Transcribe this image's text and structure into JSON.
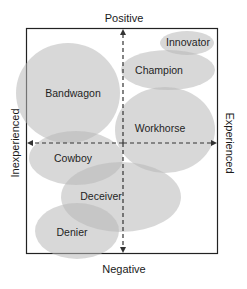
{
  "axes": {
    "top": "Positive",
    "bottom": "Negative",
    "left": "Inexperienced",
    "right": "Experienced"
  },
  "colors": {
    "ellipse_fill": "#b8b8b8",
    "ellipse_opacity": 0.55,
    "frame": "#222222",
    "axis": "#333333",
    "background": "#ffffff"
  },
  "categories": [
    {
      "label": "Innovator",
      "cx": 187,
      "cy": 43,
      "rx": 27,
      "ry": 12,
      "lx": 188,
      "ly": 46
    },
    {
      "label": "Champion",
      "cx": 168,
      "cy": 70,
      "rx": 47,
      "ry": 20,
      "lx": 159,
      "ly": 74
    },
    {
      "label": "Bandwagon",
      "cx": 68,
      "cy": 93,
      "rx": 52,
      "ry": 50,
      "lx": 73,
      "ly": 97
    },
    {
      "label": "Workhorse",
      "cx": 165,
      "cy": 130,
      "rx": 50,
      "ry": 43,
      "lx": 160,
      "ly": 132
    },
    {
      "label": "Cowboy",
      "cx": 76,
      "cy": 158,
      "rx": 47,
      "ry": 27,
      "lx": 73,
      "ly": 162
    },
    {
      "label": "Deceiver",
      "cx": 121,
      "cy": 197,
      "rx": 60,
      "ry": 35,
      "lx": 101,
      "ly": 200
    },
    {
      "label": "Denier",
      "cx": 77,
      "cy": 231,
      "rx": 42,
      "ry": 28,
      "lx": 72,
      "ly": 236
    }
  ]
}
